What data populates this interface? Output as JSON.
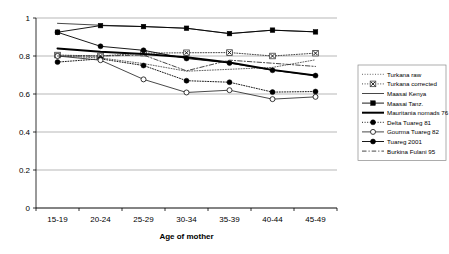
{
  "chart_data": {
    "type": "line",
    "title": "",
    "xlabel": "Age of mother",
    "ylabel": "",
    "categories": [
      "15-19",
      "20-24",
      "25-29",
      "30-34",
      "35-39",
      "40-44",
      "45-49"
    ],
    "ylim": [
      0,
      1
    ],
    "yticks": [
      "0",
      "0.2",
      "0.4",
      "0.6",
      "0.8",
      "1"
    ],
    "ytick_values": [
      0,
      0.2,
      0.4,
      0.6,
      0.8,
      1
    ],
    "grid": true,
    "legend_position": "right",
    "series": [
      {
        "name": "Turkana raw",
        "values": [
          0.8,
          0.79,
          0.76,
          0.72,
          0.73,
          0.74,
          0.78
        ],
        "line_style": "dotted",
        "marker": "none",
        "color": "#555555",
        "width": 0.9
      },
      {
        "name": "Turkana corrected",
        "values": [
          0.805,
          0.8,
          0.815,
          0.817,
          0.818,
          0.8,
          0.815
        ],
        "line_style": "dotted",
        "marker": "x-box",
        "color": "#333333",
        "width": 0.9
      },
      {
        "name": "Maasai Kenya",
        "values": [
          0.972,
          0.962,
          0.955,
          0.946,
          0.918,
          0.936,
          0.927
        ],
        "line_style": "solid",
        "marker": "none",
        "color": "#333333",
        "width": 0.9
      },
      {
        "name": "Maasai Tanz.",
        "values": [
          0.925,
          0.96,
          0.955,
          0.946,
          0.918,
          0.936,
          0.927
        ],
        "line_style": "solid",
        "marker": "filled-square",
        "color": "#000000",
        "width": 0.9
      },
      {
        "name": "Mauritania nomads 76",
        "values": [
          0.84,
          0.822,
          0.81,
          0.793,
          0.766,
          0.727,
          0.697
        ],
        "line_style": "solid",
        "marker": "none",
        "color": "#000000",
        "width": 2.0
      },
      {
        "name": "Delta Tuareg 81",
        "values": [
          0.768,
          0.785,
          0.75,
          0.67,
          0.662,
          0.61,
          0.613
        ],
        "line_style": "dotted",
        "marker": "filled-circle",
        "color": "#000000",
        "width": 0.9
      },
      {
        "name": "Gourma Tuareg 82",
        "values": [
          0.8,
          0.778,
          0.677,
          0.608,
          0.62,
          0.573,
          0.585
        ],
        "line_style": "solid",
        "marker": "open-circle",
        "color": "#333333",
        "width": 0.9
      },
      {
        "name": "Tuareg 2001",
        "values": [
          0.925,
          0.851,
          0.83,
          0.787,
          0.763,
          0.725,
          0.697
        ],
        "line_style": "solid",
        "marker": "filled-circle",
        "color": "#000000",
        "width": 0.9
      },
      {
        "name": "Burkina Fulani 95",
        "values": [
          0.8,
          0.8,
          0.805,
          0.722,
          0.778,
          0.762,
          0.745
        ],
        "line_style": "dashed",
        "marker": "none",
        "color": "#333333",
        "width": 0.9
      }
    ]
  }
}
